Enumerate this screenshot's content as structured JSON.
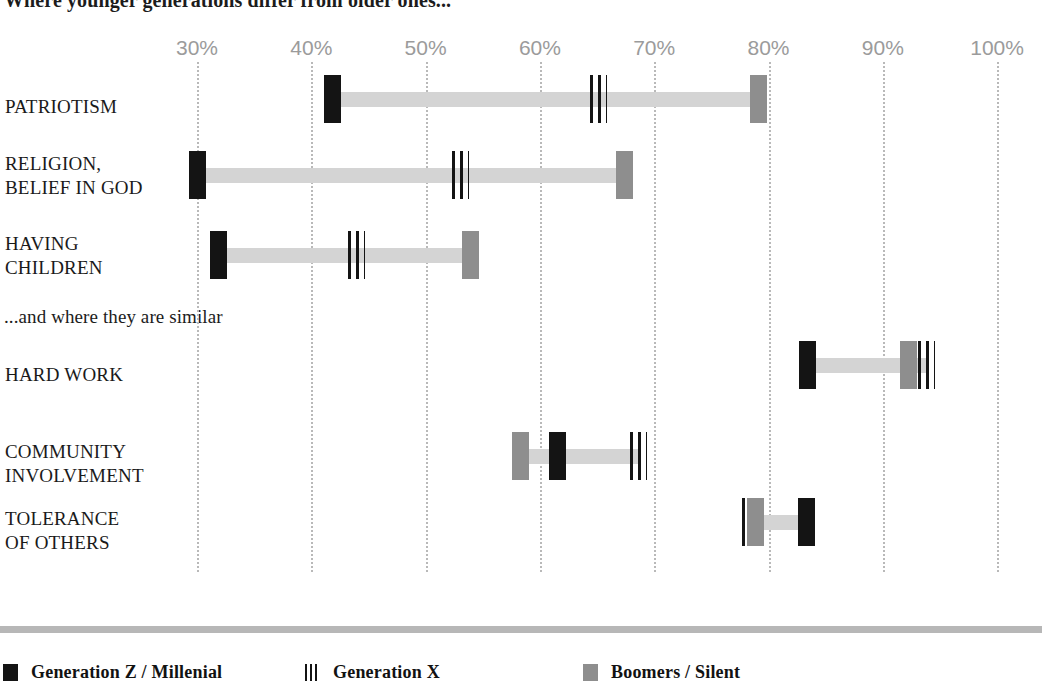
{
  "headlines": {
    "top": "Where younger generations differ from older ones...",
    "middle": "...and  where they are similar"
  },
  "chart_data": {
    "type": "scatter",
    "title": "Where younger generations differ from older ones...",
    "subtitle": "...and  where they are similar",
    "xlabel": "",
    "ylabel": "",
    "xlim": [
      25,
      103
    ],
    "xunit": "%",
    "grid": true,
    "legend_position": "bottom",
    "axis_ticks": [
      {
        "label": "30%",
        "value": 30
      },
      {
        "label": "40%",
        "value": 40
      },
      {
        "label": "50%",
        "value": 50
      },
      {
        "label": "60%",
        "value": 60
      },
      {
        "label": "70%",
        "value": 70
      },
      {
        "label": "80%",
        "value": 80
      },
      {
        "label": "90%",
        "value": 90
      },
      {
        "label": "100%",
        "value": 100
      }
    ],
    "series": [
      {
        "name": "Generation Z / Millenial",
        "key": "genz",
        "style": "solid-black",
        "color": "#141414"
      },
      {
        "name": "Generation X",
        "key": "genx",
        "style": "hatched",
        "color": "#141414"
      },
      {
        "name": "Boomers / Silent",
        "key": "boomers",
        "style": "solid-gray",
        "color": "#8e8e8e"
      }
    ],
    "groups": [
      {
        "heading": "Where younger generations differ from older ones...",
        "categories": [
          {
            "label": "PATRIOTISM",
            "genz": 41.8,
            "genx": 65.1,
            "boomers": 79.1
          },
          {
            "label": "RELIGION,\nBELIEF IN GOD",
            "genz": 30.0,
            "genx": 53.0,
            "boomers": 67.4
          },
          {
            "label": "HAVING\nCHILDREN",
            "genz": 31.8,
            "genx": 43.9,
            "boomers": 53.9
          }
        ]
      },
      {
        "heading": "...and  where they are similar",
        "categories": [
          {
            "label": "HARD WORK",
            "genz": 83.4,
            "genx": 93.8,
            "boomers": 92.2
          },
          {
            "label": "COMMUNITY\nINVOLVEMENT",
            "genz": 61.5,
            "genx": 68.6,
            "boomers": 58.3
          },
          {
            "label": "TOLERANCE\nOF OTHERS",
            "genz": 83.3,
            "genx": 78.4,
            "boomers": 78.8
          }
        ]
      }
    ]
  },
  "legend": [
    {
      "label": "Generation Z / Millenial",
      "style": "sw-black",
      "left": 3
    },
    {
      "label": "Generation X",
      "style": "sw-hatch",
      "left": 305
    },
    {
      "label": "Boomers / Silent",
      "style": "sw-gray",
      "left": 583
    }
  ]
}
